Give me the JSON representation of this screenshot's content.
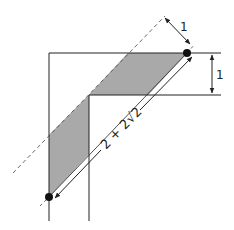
{
  "diagram": {
    "type": "geometry-figure",
    "colors": {
      "line": "#222222",
      "shade": "#a9a9a9",
      "dot": "#111111",
      "background": "#ffffff"
    },
    "labels": {
      "perpendicular_distance": "1",
      "corridor_width": "1",
      "segment_length": "2 + 2",
      "segment_length_radical": "√2",
      "segment_length_full": "2 + 2√2"
    },
    "points": [
      {
        "name": "top-right-endpoint",
        "x": 187,
        "y": 53
      },
      {
        "name": "bottom-left-endpoint",
        "x": 49,
        "y": 197
      }
    ]
  }
}
